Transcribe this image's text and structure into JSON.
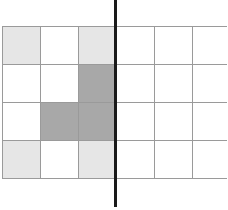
{
  "grid": {
    "rows": 4,
    "cols": 6,
    "cells": [
      [
        "light",
        "white",
        "light",
        "white",
        "white",
        "white"
      ],
      [
        "white",
        "white",
        "dark",
        "white",
        "white",
        "white"
      ],
      [
        "white",
        "dark",
        "dark",
        "white",
        "white",
        "white"
      ],
      [
        "light",
        "white",
        "light",
        "white",
        "white",
        "white"
      ]
    ]
  },
  "colors": {
    "white": "#ffffff",
    "light": "#e6e6e6",
    "dark": "#a8a8a8",
    "gridline": "#9a9a9a",
    "mirror_line": "#1a1a1a"
  },
  "mirror_line": {
    "orientation": "vertical",
    "between_columns": [
      2,
      3
    ]
  }
}
